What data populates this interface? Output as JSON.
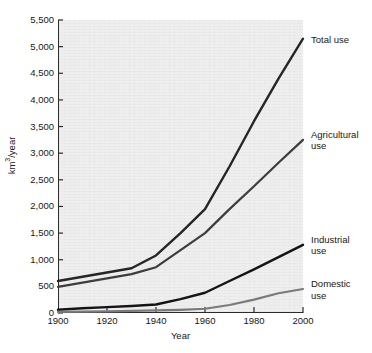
{
  "chart_data": {
    "type": "line",
    "title": "",
    "xlabel": "Year",
    "ylabel": "km3/year",
    "ylabel_parts": {
      "prefix": "km",
      "sup": "3",
      "suffix": "/year"
    },
    "xlim": [
      1900,
      2000
    ],
    "ylim": [
      0,
      5500
    ],
    "yticks": [
      0,
      500,
      1000,
      1500,
      2000,
      2500,
      3000,
      3500,
      4000,
      4500,
      5000,
      5500
    ],
    "ytick_labels": [
      "0",
      "500",
      "1,000",
      "1,500",
      "2,000",
      "2,500",
      "3,000",
      "3,500",
      "4,000",
      "4,500",
      "5,000",
      "5,500"
    ],
    "xticks": [
      1900,
      1920,
      1940,
      1960,
      1980,
      2000
    ],
    "xtick_labels": [
      "1900",
      "1920",
      "1940",
      "1960",
      "1980",
      "2000"
    ],
    "grid": false,
    "legend_position": "right-inline-annotations",
    "plot_background": "#eeeeee",
    "x": [
      1900,
      1910,
      1920,
      1930,
      1940,
      1950,
      1960,
      1970,
      1980,
      1990,
      2000
    ],
    "series": [
      {
        "name": "Total use",
        "label": "Total use",
        "label_lines": [
          "Total use"
        ],
        "color": "#262626",
        "width": 2.4,
        "values": [
          600,
          680,
          760,
          840,
          1080,
          1500,
          1950,
          2750,
          3600,
          4400,
          5150
        ]
      },
      {
        "name": "Agricultural use",
        "label": "Agricultural use",
        "label_lines": [
          "Agricultural",
          "use"
        ],
        "color": "#3d3d3d",
        "width": 2.2,
        "values": [
          490,
          570,
          650,
          730,
          860,
          1180,
          1500,
          1950,
          2380,
          2820,
          3250
        ]
      },
      {
        "name": "Industrial use",
        "label": "Industrial use",
        "label_lines": [
          "Industrial",
          "use"
        ],
        "color": "#141414",
        "width": 2.4,
        "values": [
          60,
          90,
          110,
          130,
          160,
          260,
          380,
          600,
          820,
          1050,
          1280
        ]
      },
      {
        "name": "Domestic use",
        "label": "Domestic use",
        "label_lines": [
          "Domestic",
          "use"
        ],
        "color": "#7a7a7a",
        "width": 2.2,
        "values": [
          20,
          25,
          30,
          40,
          50,
          60,
          80,
          150,
          250,
          370,
          450
        ]
      }
    ]
  }
}
